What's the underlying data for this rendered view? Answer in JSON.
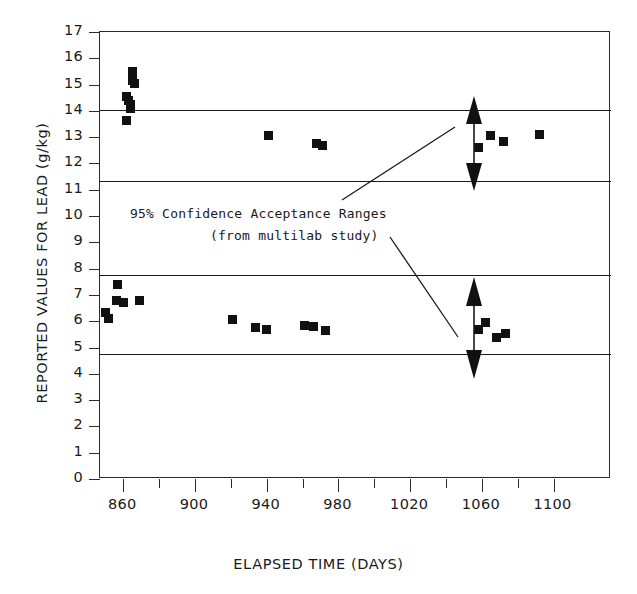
{
  "chart_data": {
    "type": "scatter",
    "title": "",
    "xlabel": "ELAPSED TIME (DAYS)",
    "ylabel": "REPORTED VALUES FOR LEAD (g/kg)",
    "xlim": [
      847,
      1132
    ],
    "ylim": [
      0,
      17
    ],
    "xticks_major": [
      860,
      900,
      940,
      980,
      1020,
      1060,
      1100
    ],
    "xticks_minor": [
      880,
      920,
      960,
      1000,
      1040,
      1080
    ],
    "yticks": [
      0,
      1,
      2,
      3,
      4,
      5,
      6,
      7,
      8,
      9,
      10,
      11,
      12,
      13,
      14,
      15,
      16,
      17
    ],
    "grid": false,
    "legend": "none",
    "marker": "filled-square",
    "marker_color": "#111111",
    "series": [
      {
        "name": "High-level lead samples",
        "points": [
          [
            862,
            14.55
          ],
          [
            863,
            14.4
          ],
          [
            864,
            14.25
          ],
          [
            864,
            14.1
          ],
          [
            865,
            15.5
          ],
          [
            865,
            15.15
          ],
          [
            866,
            15.05
          ],
          [
            862,
            13.65
          ],
          [
            941,
            13.05
          ],
          [
            968,
            12.75
          ],
          [
            971,
            12.7
          ],
          [
            1058,
            12.6
          ],
          [
            1065,
            13.05
          ],
          [
            1072,
            12.85
          ],
          [
            1092,
            13.1
          ]
        ]
      },
      {
        "name": "Low-level lead samples",
        "points": [
          [
            850,
            6.35
          ],
          [
            852,
            6.1
          ],
          [
            856,
            6.8
          ],
          [
            857,
            7.4
          ],
          [
            860,
            6.7
          ],
          [
            869,
            6.8
          ],
          [
            921,
            6.05
          ],
          [
            934,
            5.75
          ],
          [
            940,
            5.7
          ],
          [
            961,
            5.85
          ],
          [
            966,
            5.8
          ],
          [
            973,
            5.65
          ],
          [
            1058,
            5.7
          ],
          [
            1062,
            5.95
          ],
          [
            1068,
            5.4
          ],
          [
            1073,
            5.55
          ]
        ]
      }
    ],
    "reference_lines": [
      {
        "label": "upper-band-top",
        "value": 14.05
      },
      {
        "label": "upper-band-bottom",
        "value": 11.35
      },
      {
        "label": "lower-band-top",
        "value": 7.75
      },
      {
        "label": "lower-band-bottom",
        "value": 4.75
      }
    ],
    "annotations": [
      {
        "line1": "95% Confidence Acceptance Ranges",
        "line2": "(from multilab study)"
      }
    ]
  },
  "annotation": {
    "line1": "95% Confidence Acceptance Ranges",
    "line2": "(from multilab study)"
  },
  "axes": {
    "xlabel": "ELAPSED TIME (DAYS)",
    "ylabel": "REPORTED VALUES FOR LEAD (g/kg)"
  }
}
